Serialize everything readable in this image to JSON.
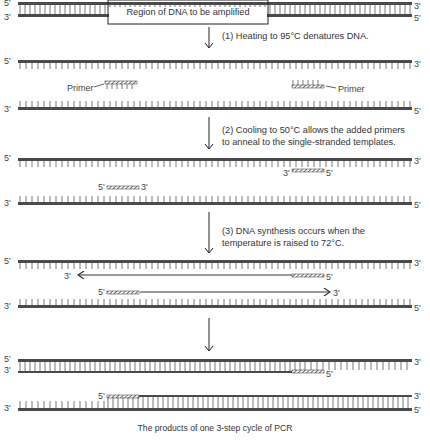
{
  "diagram": {
    "title_box_label": "Region of DNA to be amplified",
    "caption": "The products of one 3-step cycle of PCR",
    "colors": {
      "strand": "#4a4a4a",
      "tick": "#555555",
      "text": "#333333",
      "primer_fill": "#ffffff"
    },
    "steps": [
      {
        "id": 1,
        "lines": [
          "(1) Heating to 95°C denatures DNA."
        ]
      },
      {
        "id": 2,
        "lines": [
          "(2) Cooling to 50°C allows the added primers",
          "to anneal to the single-stranded templates."
        ]
      },
      {
        "id": 3,
        "lines": [
          "(3) DNA synthesis occurs when the",
          "temperature is raised to 72°C."
        ]
      }
    ],
    "labels": {
      "five_prime": "5'",
      "three_prime": "3'",
      "primer": "Primer"
    }
  }
}
